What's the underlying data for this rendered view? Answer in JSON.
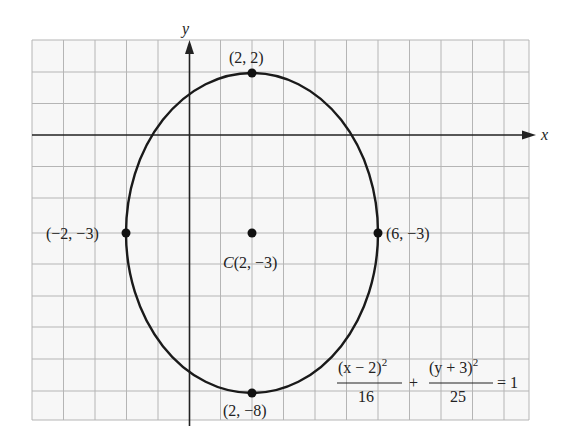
{
  "figure": {
    "axes": {
      "x_label": "x",
      "y_label": "y"
    },
    "grid": {
      "x_min": -5,
      "x_max": 11,
      "y_min": -9,
      "y_max": 3,
      "step": 1
    },
    "ellipse": {
      "center": [
        2,
        -3
      ],
      "a": 4,
      "b": 5
    },
    "points": [
      {
        "id": "top",
        "coord": [
          2,
          2
        ],
        "label": "(2, 2)"
      },
      {
        "id": "left",
        "coord": [
          -2,
          -3
        ],
        "label": "(−2, −3)"
      },
      {
        "id": "right",
        "coord": [
          6,
          -3
        ],
        "label": "(6, −3)"
      },
      {
        "id": "center",
        "coord": [
          2,
          -3
        ],
        "label_prefix": "C",
        "label": "(2, −3)"
      },
      {
        "id": "bottom",
        "coord": [
          2,
          -8
        ],
        "label": "(2, −8)"
      }
    ],
    "equation": {
      "term1_num": "(x − 2)",
      "term1_exp": "2",
      "term1_den": "16",
      "plus": "+",
      "term2_num": "(y + 3)",
      "term2_exp": "2",
      "term2_den": "25",
      "rhs": "= 1"
    },
    "colors": {
      "grid": "#b0b0b0",
      "axis": "#222222",
      "curve": "#1a1a1a",
      "background": "#f7f7f7"
    }
  }
}
